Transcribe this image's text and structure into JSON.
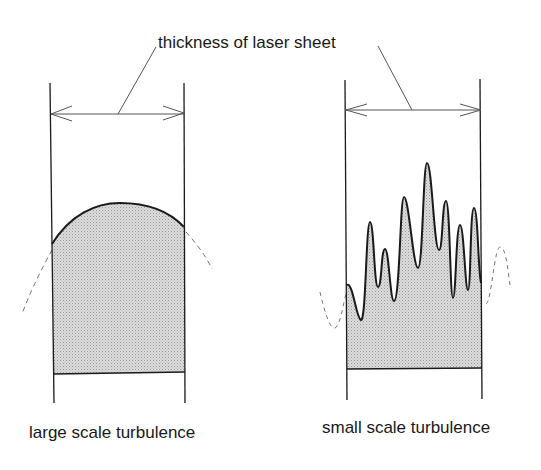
{
  "diagram": {
    "top_label": "thickness of laser sheet",
    "panels": [
      {
        "caption": "large scale turbulence",
        "fill_color": "#d4d4d4"
      },
      {
        "caption": "small scale turbulence",
        "fill_color": "#d4d4d4"
      }
    ],
    "colors": {
      "line": "#1a1a1a",
      "thin_line": "#555555",
      "dashed": "#777777"
    }
  }
}
